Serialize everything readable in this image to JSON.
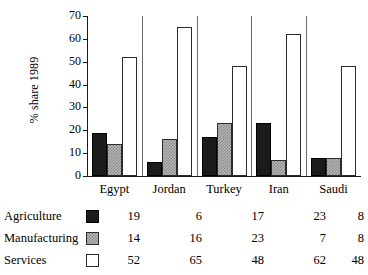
{
  "chart_data": {
    "type": "bar",
    "title": "",
    "xlabel": "",
    "ylabel": "% share 1989",
    "ylim": [
      0,
      70
    ],
    "yticks": [
      0,
      10,
      20,
      30,
      40,
      50,
      60,
      70
    ],
    "grid": false,
    "legend_position": "below-as-table",
    "categories": [
      "Egypt",
      "Jordan",
      "Turkey",
      "Iran",
      "Saudi"
    ],
    "series": [
      {
        "name": "Agriculture",
        "swatch": "black",
        "values": [
          19,
          6,
          17,
          23,
          8
        ]
      },
      {
        "name": "Manufacturing",
        "swatch": "gray-hatched",
        "values": [
          14,
          16,
          23,
          7,
          8
        ]
      },
      {
        "name": "Services",
        "swatch": "white",
        "values": [
          52,
          65,
          48,
          62,
          48
        ]
      }
    ]
  },
  "colors": {
    "agriculture": "#1b1b1b",
    "manufacturing": "#b5b5b5",
    "services": "#ffffff",
    "axis": "#1a1a1a",
    "separator": "#6b6b6b",
    "background": "#ffffff"
  }
}
